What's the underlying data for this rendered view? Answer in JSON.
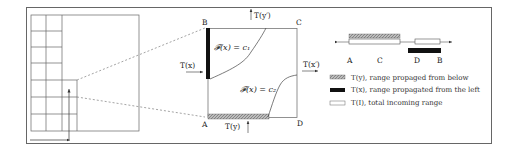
{
  "diagram": {
    "corners": {
      "A": "A",
      "B": "B",
      "C": "C",
      "D": "D"
    },
    "flows": {
      "left_in": "T(x)",
      "bottom_in": "T(y)",
      "top_out": "T(y′)",
      "right_out": "T(x′)"
    },
    "curves": {
      "upper": "𝓕(x) = c₁",
      "lower": "𝓕(x) = c₂"
    },
    "interval_labels": [
      "A",
      "C",
      "D",
      "B"
    ],
    "legend": [
      {
        "swatch": "hatched",
        "text": "T(y), range propaged from below"
      },
      {
        "swatch": "black",
        "text": "T(x), range propagated from the left"
      },
      {
        "swatch": "white",
        "text": "T(I), total incoming range"
      }
    ],
    "colors": {
      "line": "#555555",
      "dark": "#111111",
      "hatch": "#9a9a9a",
      "frame": "#666666"
    }
  }
}
